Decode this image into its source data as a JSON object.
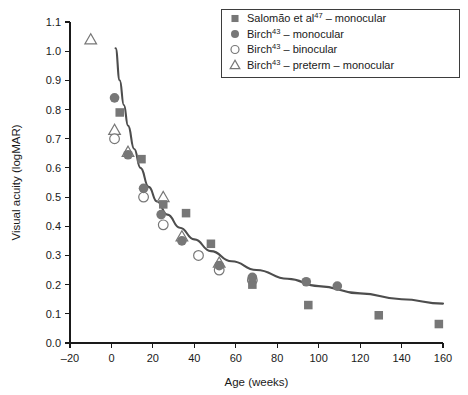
{
  "chart_data": {
    "type": "scatter",
    "title": "",
    "xlabel": "Age (weeks)",
    "ylabel": "Visual acuity (logMAR)",
    "xlim": [
      -20,
      160
    ],
    "ylim": [
      0.0,
      1.1
    ],
    "xticks": [
      -20,
      0,
      20,
      40,
      60,
      80,
      100,
      120,
      140,
      160
    ],
    "xtick_labels": [
      "–20",
      "0",
      "20",
      "40",
      "60",
      "80",
      "100",
      "120",
      "140",
      "160"
    ],
    "yticks": [
      0.0,
      0.1,
      0.2,
      0.3,
      0.4,
      0.5,
      0.6,
      0.7,
      0.8,
      0.9,
      1.0,
      1.1
    ],
    "ytick_labels": [
      "0.0",
      "0.1",
      "0.2",
      "0.3",
      "0.4",
      "0.5",
      "0.6",
      "0.7",
      "0.8",
      "0.9",
      "1.0",
      "1.1"
    ],
    "grid": false,
    "legend_position": "top-right",
    "marker_color": "#777777",
    "curve_color": "#4d4d4d",
    "series": [
      {
        "name": "Salomão et al47 – monocular",
        "marker": "filled-square",
        "points": [
          {
            "x": 4,
            "y": 0.79
          },
          {
            "x": 14.5,
            "y": 0.63
          },
          {
            "x": 25,
            "y": 0.475
          },
          {
            "x": 36,
            "y": 0.445
          },
          {
            "x": 48,
            "y": 0.34
          },
          {
            "x": 68,
            "y": 0.2
          },
          {
            "x": 95,
            "y": 0.13
          },
          {
            "x": 129,
            "y": 0.095
          },
          {
            "x": 158,
            "y": 0.065
          }
        ]
      },
      {
        "name": "Birch43 – monocular",
        "marker": "filled-circle",
        "points": [
          {
            "x": 1.5,
            "y": 0.84
          },
          {
            "x": 8,
            "y": 0.645
          },
          {
            "x": 15.5,
            "y": 0.53
          },
          {
            "x": 24,
            "y": 0.44
          },
          {
            "x": 34,
            "y": 0.35
          },
          {
            "x": 52,
            "y": 0.265
          },
          {
            "x": 68,
            "y": 0.225
          },
          {
            "x": 94,
            "y": 0.21
          },
          {
            "x": 109,
            "y": 0.195
          }
        ]
      },
      {
        "name": "Birch43 – binocular",
        "marker": "open-circle",
        "points": [
          {
            "x": 1.5,
            "y": 0.7
          },
          {
            "x": 15.5,
            "y": 0.5
          },
          {
            "x": 25,
            "y": 0.405
          },
          {
            "x": 42,
            "y": 0.3
          },
          {
            "x": 52,
            "y": 0.25
          },
          {
            "x": 68,
            "y": 0.215
          }
        ]
      },
      {
        "name": "Birch43 – preterm – monocular",
        "marker": "open-triangle",
        "points": [
          {
            "x": -10,
            "y": 1.04
          },
          {
            "x": 1.5,
            "y": 0.73
          },
          {
            "x": 8,
            "y": 0.655
          },
          {
            "x": 25,
            "y": 0.5
          },
          {
            "x": 34,
            "y": 0.365
          },
          {
            "x": 52,
            "y": 0.275
          }
        ]
      }
    ],
    "fit_curve": {
      "description": "decaying fitted curve",
      "points": [
        {
          "x": 2,
          "y": 1.01
        },
        {
          "x": 4,
          "y": 0.9
        },
        {
          "x": 6,
          "y": 0.815
        },
        {
          "x": 8,
          "y": 0.745
        },
        {
          "x": 11,
          "y": 0.665
        },
        {
          "x": 14,
          "y": 0.6
        },
        {
          "x": 18,
          "y": 0.535
        },
        {
          "x": 22,
          "y": 0.485
        },
        {
          "x": 27,
          "y": 0.44
        },
        {
          "x": 33,
          "y": 0.395
        },
        {
          "x": 40,
          "y": 0.355
        },
        {
          "x": 48,
          "y": 0.315
        },
        {
          "x": 58,
          "y": 0.28
        },
        {
          "x": 70,
          "y": 0.25
        },
        {
          "x": 85,
          "y": 0.22
        },
        {
          "x": 100,
          "y": 0.195
        },
        {
          "x": 120,
          "y": 0.17
        },
        {
          "x": 140,
          "y": 0.15
        },
        {
          "x": 160,
          "y": 0.135
        }
      ]
    },
    "legend": [
      {
        "label_main": "Salomão et al",
        "sup": "47",
        "label_rest": " – monocular",
        "marker": "filled-square"
      },
      {
        "label_main": "Birch",
        "sup": "43",
        "label_rest": " – monocular",
        "marker": "filled-circle"
      },
      {
        "label_main": "Birch",
        "sup": "43",
        "label_rest": " – binocular",
        "marker": "open-circle"
      },
      {
        "label_main": "Birch",
        "sup": "43",
        "label_rest": " – preterm – monocular",
        "marker": "open-triangle"
      }
    ]
  }
}
